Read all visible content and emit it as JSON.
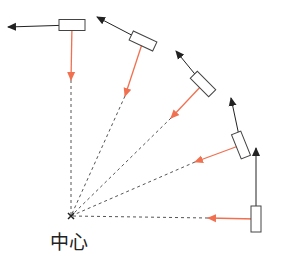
{
  "diagram": {
    "type": "circular-motion",
    "center": {
      "x": 71,
      "y": 216,
      "label": "中心"
    },
    "colors": {
      "velocity": "#222222",
      "centripetal": "#f07050",
      "radius": "#555555",
      "block_stroke": "#444444"
    },
    "positions": [
      {
        "block": {
          "cx": 256,
          "cy": 219,
          "w": 10,
          "h": 26,
          "angle": 0
        },
        "velocity_tip": {
          "x": 256,
          "y": 148
        },
        "force_tip": {
          "x": 208,
          "y": 218
        },
        "radius_from": {
          "x": 208,
          "y": 218
        }
      },
      {
        "block": {
          "cx": 241,
          "cy": 145,
          "w": 10,
          "h": 26,
          "angle": -22
        },
        "velocity_tip": {
          "x": 231,
          "y": 98
        },
        "force_tip": {
          "x": 195,
          "y": 162
        },
        "radius_from": {
          "x": 195,
          "y": 162
        }
      },
      {
        "block": {
          "cx": 203,
          "cy": 84,
          "w": 10,
          "h": 26,
          "angle": -45
        },
        "velocity_tip": {
          "x": 176,
          "y": 51
        },
        "force_tip": {
          "x": 171,
          "y": 118
        },
        "radius_from": {
          "x": 171,
          "y": 118
        }
      },
      {
        "block": {
          "cx": 143,
          "cy": 41,
          "w": 26,
          "h": 10,
          "angle": 25
        },
        "velocity_tip": {
          "x": 97,
          "y": 17
        },
        "force_tip": {
          "x": 125,
          "y": 96
        },
        "radius_from": {
          "x": 125,
          "y": 96
        }
      },
      {
        "block": {
          "cx": 72,
          "cy": 25,
          "w": 26,
          "h": 11,
          "angle": 0
        },
        "velocity_tip": {
          "x": 8,
          "y": 27
        },
        "force_tip": {
          "x": 71,
          "y": 80
        },
        "radius_from": {
          "x": 71,
          "y": 80
        }
      }
    ]
  }
}
